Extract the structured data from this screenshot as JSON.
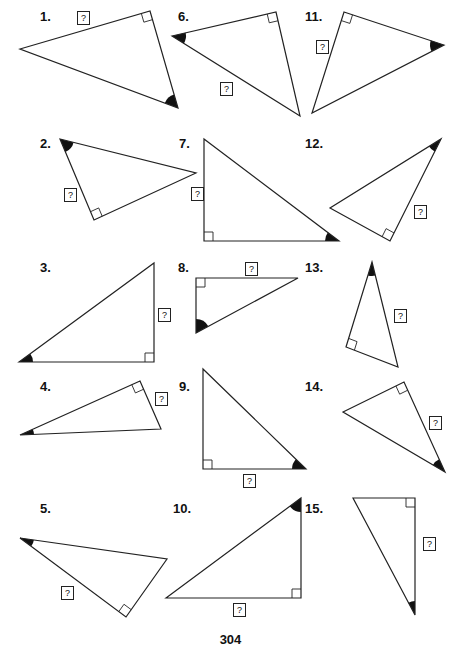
{
  "page": {
    "page_number": "304",
    "unknown_label": "?"
  },
  "problems": [
    {
      "number": "1.",
      "label_pos": [
        40,
        10
      ],
      "vertices": [
        [
          20,
          49
        ],
        [
          150,
          11
        ],
        [
          178,
          108
        ]
      ],
      "right_angle_vertex": 1,
      "shaded_angle_vertex": 2,
      "unknown_box": [
        77,
        11
      ]
    },
    {
      "number": "2.",
      "label_pos": [
        40,
        137
      ],
      "vertices": [
        [
          60,
          139
        ],
        [
          196,
          173
        ],
        [
          94,
          220
        ]
      ],
      "right_angle_vertex": 2,
      "shaded_angle_vertex": 0,
      "unknown_box": [
        64,
        188
      ]
    },
    {
      "number": "3.",
      "label_pos": [
        40,
        261
      ],
      "vertices": [
        [
          19,
          362
        ],
        [
          154,
          263
        ],
        [
          154,
          362
        ]
      ],
      "right_angle_vertex": 2,
      "shaded_angle_vertex": 0,
      "unknown_box": [
        158,
        308
      ]
    },
    {
      "number": "4.",
      "label_pos": [
        40,
        380
      ],
      "vertices": [
        [
          20,
          435
        ],
        [
          140,
          381
        ],
        [
          161,
          429
        ]
      ],
      "right_angle_vertex": 1,
      "shaded_angle_vertex": 0,
      "unknown_box": [
        155,
        392
      ]
    },
    {
      "number": "5.",
      "label_pos": [
        40,
        502
      ],
      "vertices": [
        [
          20,
          538
        ],
        [
          167,
          559
        ],
        [
          126,
          617
        ]
      ],
      "right_angle_vertex": 2,
      "shaded_angle_vertex": 0,
      "unknown_box": [
        61,
        586
      ]
    },
    {
      "number": "6.",
      "label_pos": [
        178,
        10
      ],
      "vertices": [
        [
          172,
          36
        ],
        [
          276,
          12
        ],
        [
          300,
          116
        ]
      ],
      "right_angle_vertex": 1,
      "shaded_angle_vertex": 0,
      "unknown_box": [
        220,
        82
      ]
    },
    {
      "number": "7.",
      "label_pos": [
        179,
        137
      ],
      "vertices": [
        [
          204,
          139
        ],
        [
          204,
          241
        ],
        [
          339,
          241
        ]
      ],
      "right_angle_vertex": 1,
      "shaded_angle_vertex": 2,
      "unknown_box": [
        191,
        187
      ]
    },
    {
      "number": "8.",
      "label_pos": [
        178,
        261
      ],
      "vertices": [
        [
          196,
          278
        ],
        [
          298,
          278
        ],
        [
          196,
          333
        ]
      ],
      "right_angle_vertex": 0,
      "shaded_angle_vertex": 2,
      "unknown_box": [
        245,
        262
      ]
    },
    {
      "number": "9.",
      "label_pos": [
        179,
        380
      ],
      "vertices": [
        [
          203,
          369
        ],
        [
          203,
          469
        ],
        [
          306,
          469
        ]
      ],
      "right_angle_vertex": 1,
      "shaded_angle_vertex": 2,
      "unknown_box": [
        243,
        474
      ]
    },
    {
      "number": "10.",
      "label_pos": [
        173,
        502
      ],
      "vertices": [
        [
          166,
          598
        ],
        [
          301,
          498
        ],
        [
          301,
          598
        ]
      ],
      "right_angle_vertex": 2,
      "shaded_angle_vertex": 1,
      "unknown_box": [
        233,
        603
      ]
    },
    {
      "number": "11.",
      "label_pos": [
        305,
        10
      ],
      "vertices": [
        [
          344,
          12
        ],
        [
          444,
          45
        ],
        [
          312,
          113
        ]
      ],
      "right_angle_vertex": 0,
      "shaded_angle_vertex": 1,
      "unknown_box": [
        316,
        40
      ]
    },
    {
      "number": "12.",
      "label_pos": [
        305,
        137
      ],
      "vertices": [
        [
          441,
          139
        ],
        [
          390,
          241
        ],
        [
          330,
          208
        ]
      ],
      "right_angle_vertex": 1,
      "shaded_angle_vertex": 0,
      "unknown_box": [
        414,
        205
      ]
    },
    {
      "number": "13.",
      "label_pos": [
        305,
        261
      ],
      "vertices": [
        [
          372,
          262
        ],
        [
          398,
          367
        ],
        [
          346,
          347
        ]
      ],
      "right_angle_vertex": 2,
      "shaded_angle_vertex": 0,
      "unknown_box": [
        394,
        309
      ]
    },
    {
      "number": "14.",
      "label_pos": [
        305,
        380
      ],
      "vertices": [
        [
          343,
          412
        ],
        [
          404,
          382
        ],
        [
          445,
          472
        ]
      ],
      "right_angle_vertex": 1,
      "shaded_angle_vertex": 2,
      "unknown_box": [
        429,
        416
      ]
    },
    {
      "number": "15.",
      "label_pos": [
        305,
        502
      ],
      "vertices": [
        [
          353,
          498
        ],
        [
          415,
          498
        ],
        [
          415,
          615
        ]
      ],
      "right_angle_vertex": 1,
      "shaded_angle_vertex": 2,
      "unknown_box": [
        423,
        537
      ]
    }
  ]
}
